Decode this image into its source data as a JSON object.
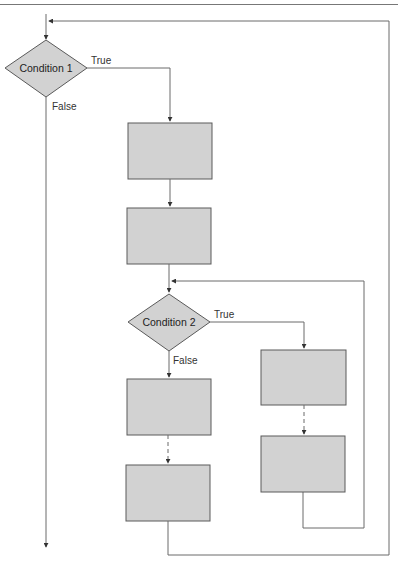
{
  "diagram": {
    "type": "flowchart",
    "colors": {
      "shape_fill": "#d2d2d2",
      "shape_stroke": "#5a5a5a",
      "line": "#6a6a6a",
      "text": "#222222"
    },
    "decisions": [
      {
        "id": "condition-1",
        "label": "Condition 1",
        "true_label": "True",
        "false_label": "False"
      },
      {
        "id": "condition-2",
        "label": "Condition 2",
        "true_label": "True",
        "false_label": "False"
      }
    ],
    "process_boxes": [
      {
        "id": "box-1",
        "label": ""
      },
      {
        "id": "box-2",
        "label": ""
      },
      {
        "id": "box-3",
        "label": ""
      },
      {
        "id": "box-4",
        "label": ""
      },
      {
        "id": "box-5",
        "label": ""
      },
      {
        "id": "box-6",
        "label": ""
      }
    ]
  }
}
